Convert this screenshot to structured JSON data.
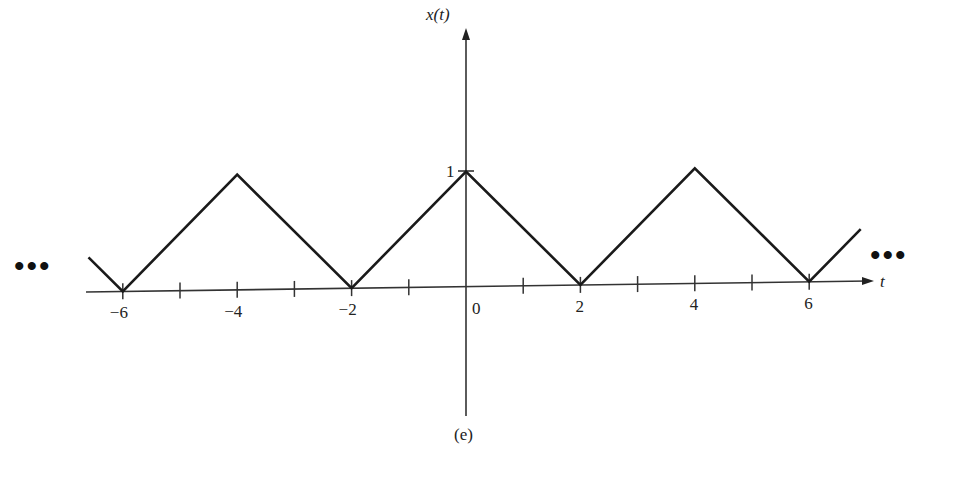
{
  "chart_data": {
    "type": "line",
    "title": "",
    "caption": "(e)",
    "xlabel": "t",
    "ylabel": "x(t)",
    "x_ticks": [
      -6,
      -5,
      -4,
      -3,
      -2,
      -1,
      0,
      1,
      2,
      3,
      4,
      5,
      6
    ],
    "x_tick_labels": [
      "−6",
      "−4",
      "−2",
      "0",
      "2",
      "4",
      "6"
    ],
    "x_tick_label_values": [
      -6,
      -4,
      -2,
      0,
      2,
      4,
      6
    ],
    "y_tick_labels": [
      "1"
    ],
    "y_tick_values": [
      1
    ],
    "xlim": [
      -6.7,
      7.3
    ],
    "ylim": [
      -1.1,
      1.5
    ],
    "grid": false,
    "legend": null,
    "series": [
      {
        "name": "x(t) triangular wave (period 4)",
        "x": [
          -6.6,
          -6,
          -4,
          -2,
          0,
          2,
          4,
          6,
          6.9
        ],
        "y": [
          0.3,
          0,
          1,
          0,
          1,
          0,
          1,
          0,
          0.45
        ]
      }
    ],
    "continuation_marks": {
      "left": "•••",
      "right": "•••"
    },
    "period": 4,
    "amplitude": 1
  }
}
